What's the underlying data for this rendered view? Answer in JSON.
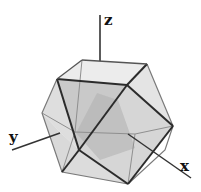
{
  "figure": {
    "axes": {
      "x": {
        "label": "x"
      },
      "y": {
        "label": "y"
      },
      "z": {
        "label": "z"
      }
    },
    "colors": {
      "edge": "#2b2b2b",
      "hidden_edge": "#8a8a8a",
      "face_light": "#e6e6e6",
      "face_mid": "#cfcfcf",
      "face_dark": "#a9a9a9",
      "axis": "#333333"
    }
  }
}
